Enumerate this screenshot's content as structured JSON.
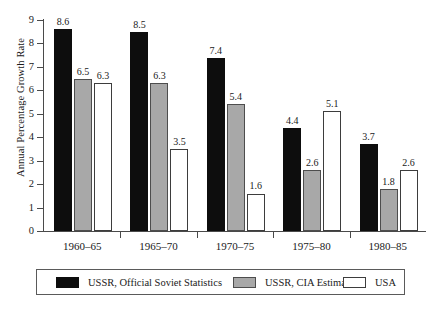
{
  "chart_data": {
    "type": "bar",
    "title": "",
    "xlabel": "",
    "ylabel": "Annual Percentage Growth Rate",
    "ylim": [
      0,
      9
    ],
    "ytick_step": 1,
    "yticks": [
      "9",
      "8",
      "7",
      "6",
      "5",
      "4",
      "3",
      "2",
      "1",
      "0"
    ],
    "grid": false,
    "legend_position": "bottom",
    "categories": [
      "1960–65",
      "1965–70",
      "1970–75",
      "1975–80",
      "1980–85"
    ],
    "series": [
      {
        "name": "USSR, Official Soviet Statistics",
        "color": "#0d0d0d",
        "values": [
          8.6,
          8.5,
          7.4,
          4.4,
          3.7
        ],
        "labels": [
          "8.6",
          "8.5",
          "7.4",
          "4.4",
          "3.7"
        ]
      },
      {
        "name": "USSR, CIA Estimate",
        "color": "#a8a8a8",
        "values": [
          6.5,
          6.3,
          5.4,
          2.6,
          1.8
        ],
        "labels": [
          "6.5",
          "6.3",
          "5.4",
          "2.6",
          "1.8"
        ]
      },
      {
        "name": "USA",
        "color": "#ffffff",
        "values": [
          6.3,
          3.5,
          1.6,
          5.1,
          2.6
        ],
        "labels": [
          "6.3",
          "3.5",
          "1.6",
          "5.1",
          "2.6"
        ]
      }
    ]
  }
}
